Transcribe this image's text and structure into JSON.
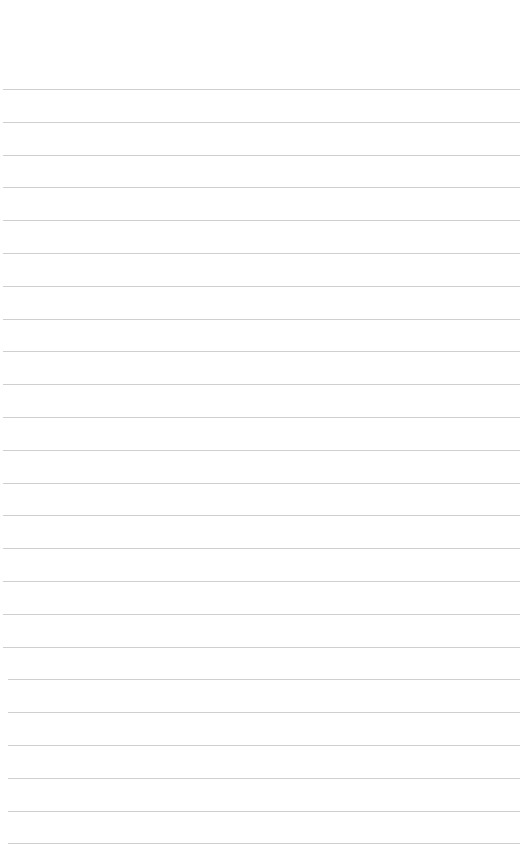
{
  "page": {
    "type": "lined-paper",
    "background_color": "#ffffff",
    "line_color": "#cfcfcf",
    "line_count": 24,
    "first_line_y": 89,
    "line_spacing": 32.8,
    "lines_text": [
      "",
      "",
      "",
      "",
      "",
      "",
      "",
      "",
      "",
      "",
      "",
      "",
      "",
      "",
      "",
      "",
      "",
      "",
      "",
      "",
      "",
      "",
      "",
      ""
    ]
  }
}
